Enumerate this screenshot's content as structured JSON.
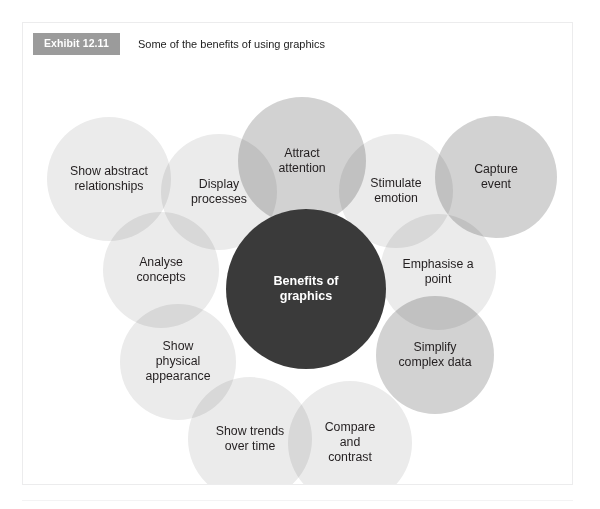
{
  "exhibit": {
    "badge": "Exhibit 12.11",
    "caption": "Some of the benefits of using graphics"
  },
  "colors": {
    "badge_background": "#9b9b9b",
    "badge_text": "#ffffff",
    "panel_border": "#ececed",
    "center_circle": "#3a3a3a",
    "center_text": "#ffffff",
    "bubble_text": "#231f20",
    "bubble_light": "#ebebeb",
    "bubble_mid": "#e0e0e0",
    "bubble_dark": "#d2d2d2"
  },
  "chart_data": {
    "type": "diagram",
    "title": "Some of the benefits of using graphics",
    "center": {
      "label_line1": "Benefits of",
      "label_line2": "graphics"
    },
    "nodes": [
      {
        "id": "show-abstract-relationships",
        "lines": [
          "Show abstract",
          "relationships"
        ],
        "cx": 86,
        "cy": 112,
        "r": 62,
        "shade": "light"
      },
      {
        "id": "display-processes",
        "lines": [
          "Display",
          "processes"
        ],
        "cx": 196,
        "cy": 125,
        "r": 58,
        "shade": "light"
      },
      {
        "id": "attract-attention",
        "lines": [
          "Attract",
          "attention"
        ],
        "cx": 279,
        "cy": 94,
        "r": 64,
        "shade": "dark"
      },
      {
        "id": "stimulate-emotion",
        "lines": [
          "Stimulate",
          "emotion"
        ],
        "cx": 373,
        "cy": 124,
        "r": 57,
        "shade": "light"
      },
      {
        "id": "capture-event",
        "lines": [
          "Capture",
          "event"
        ],
        "cx": 473,
        "cy": 110,
        "r": 61,
        "shade": "dark"
      },
      {
        "id": "analyse-concepts",
        "lines": [
          "Analyse",
          "concepts"
        ],
        "cx": 138,
        "cy": 203,
        "r": 58,
        "shade": "light"
      },
      {
        "id": "emphasise-a-point",
        "lines": [
          "Emphasise a",
          "point"
        ],
        "cx": 415,
        "cy": 205,
        "r": 58,
        "shade": "light"
      },
      {
        "id": "show-physical-appearance",
        "lines": [
          "Show",
          "physical",
          "appearance"
        ],
        "cx": 155,
        "cy": 295,
        "r": 58,
        "shade": "light"
      },
      {
        "id": "simplify-complex-data",
        "lines": [
          "Simplify",
          "complex data"
        ],
        "cx": 412,
        "cy": 288,
        "r": 59,
        "shade": "dark"
      },
      {
        "id": "show-trends-over-time",
        "lines": [
          "Show trends",
          "over time"
        ],
        "cx": 227,
        "cy": 372,
        "r": 62,
        "shade": "light"
      },
      {
        "id": "compare-and-contrast",
        "lines": [
          "Compare",
          "and",
          "contrast"
        ],
        "cx": 327,
        "cy": 376,
        "r": 62,
        "shade": "light"
      }
    ],
    "center_node": {
      "cx": 283,
      "cy": 222,
      "r": 80
    }
  }
}
